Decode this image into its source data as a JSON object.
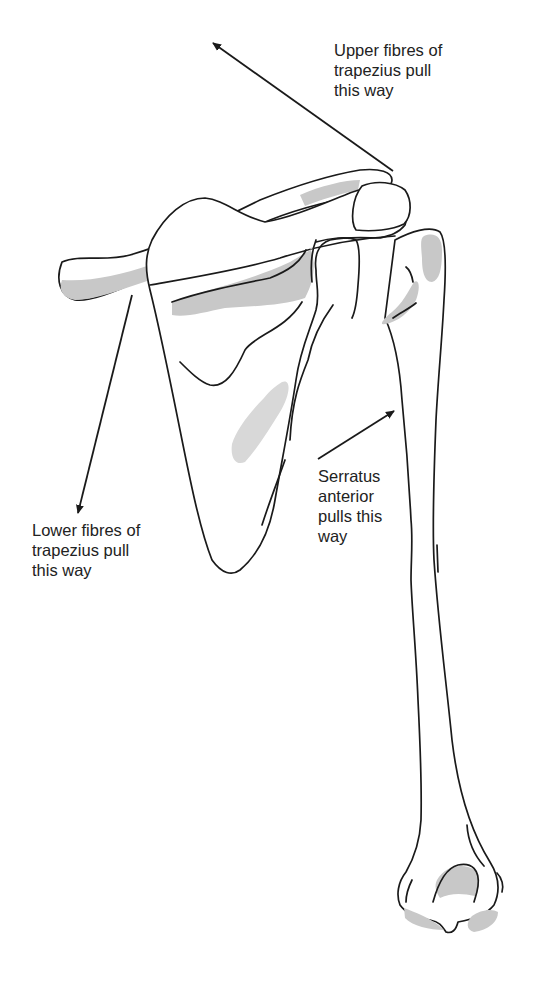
{
  "figure": {
    "colors": {
      "background": "#ffffff",
      "outline": "#1a1a1a",
      "shading": "#c8c8c8",
      "text": "#222222"
    }
  },
  "labels": {
    "upper_trapezius": {
      "lines": [
        "Upper fibres of",
        "trapezius pull",
        "this way"
      ]
    },
    "lower_trapezius": {
      "lines": [
        "Lower fibres of",
        "trapezius pull",
        "this way"
      ]
    },
    "serratus_anterior": {
      "lines": [
        "Serratus",
        "anterior",
        "pulls this",
        "way"
      ]
    }
  },
  "arrows": [
    {
      "name": "upper-trapezius-arrow",
      "from": [
        393,
        171
      ],
      "to": [
        213,
        43
      ],
      "direction": "up-left"
    },
    {
      "name": "lower-trapezius-arrow",
      "from": [
        132,
        295
      ],
      "to": [
        78,
        513
      ],
      "direction": "down-left"
    },
    {
      "name": "serratus-anterior-arrow",
      "from": [
        318,
        459
      ],
      "to": [
        394,
        411
      ],
      "direction": "up-right"
    }
  ]
}
